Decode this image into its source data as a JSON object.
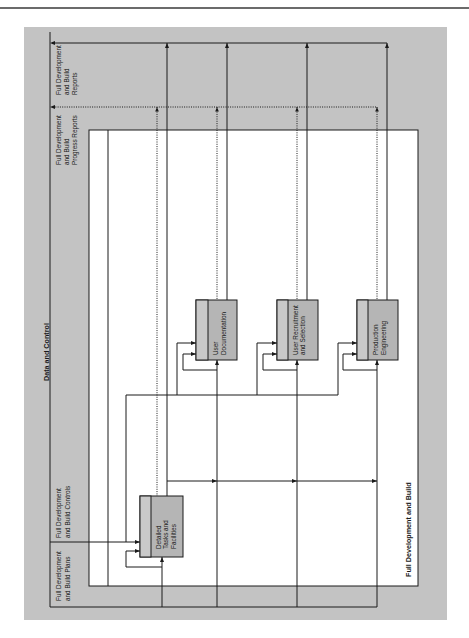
{
  "diagram": {
    "boundary_title": "Full Development and Build",
    "header_label": "Data and Control",
    "outputs": [
      {
        "name": "reports",
        "label_lines": [
          "Full Development",
          "and Build",
          "Reports"
        ],
        "line_style": "solid"
      },
      {
        "name": "progress-reports",
        "label_lines": [
          "Full Development",
          "and Build",
          "Progress Reports"
        ],
        "line_style": "dotted"
      }
    ],
    "controls": {
      "label_lines": [
        "Full Development",
        "and Build Controls"
      ]
    },
    "inputs": {
      "label_lines": [
        "Full Development",
        "and Build Plans"
      ]
    },
    "activities": [
      {
        "label_lines": [
          "Detailed",
          "Tasks and",
          "Facilities"
        ]
      },
      {
        "label_lines": [
          "User",
          "Documentation"
        ]
      },
      {
        "label_lines": [
          "User Recruitment",
          "and Selection"
        ]
      },
      {
        "label_lines": [
          "Production",
          "Engineering"
        ]
      }
    ]
  },
  "colors": {
    "background_gray": "#c3c3c3",
    "boundary_fill": "#ffffff",
    "box_fill": "#b5b5b5",
    "box_strip_fill": "#c9c9c9",
    "line": "#1a1a1a"
  }
}
